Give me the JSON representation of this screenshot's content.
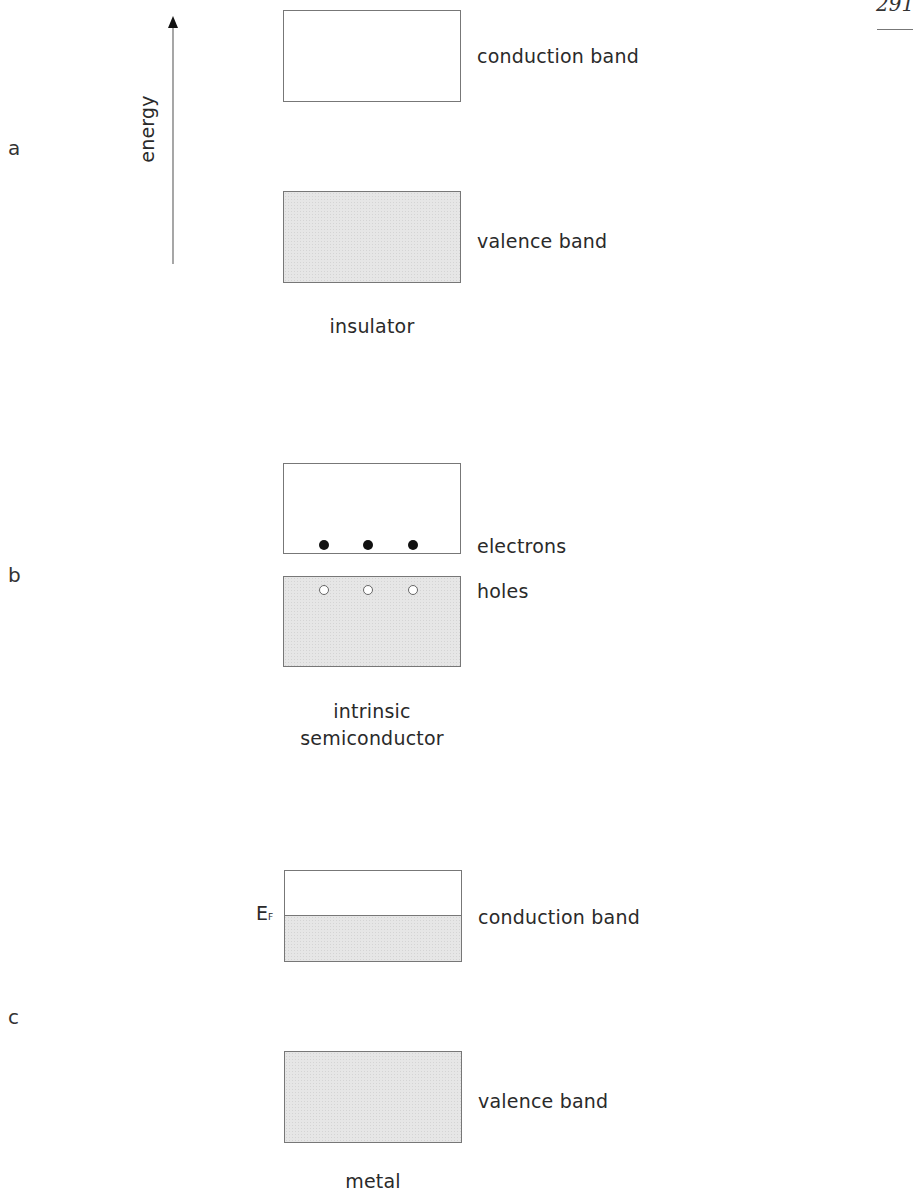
{
  "page": {
    "number": "291"
  },
  "panels": [
    {
      "letter": "a",
      "axis_label": "energy",
      "upper_band_label": "conduction band",
      "lower_band_label": "valence band",
      "caption": "insulator"
    },
    {
      "letter": "b",
      "electrons_label": "electrons",
      "holes_label": "holes",
      "caption_line1": "intrinsic",
      "caption_line2": "semiconductor"
    },
    {
      "letter": "c",
      "fermi_label": "E",
      "fermi_sub": "F",
      "upper_band_label": "conduction band",
      "lower_band_label": "valence band",
      "caption": "metal"
    }
  ],
  "colors": {
    "filled_band": "#e6e6e6",
    "outline": "#777777"
  }
}
